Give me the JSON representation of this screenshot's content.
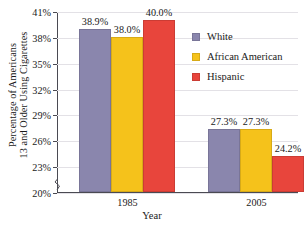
{
  "chart_data": {
    "type": "bar",
    "title": "",
    "xlabel": "Year",
    "ylabel": "Percentage of Americans 13 and Older Using Cigarettes",
    "ylabel_line1": "Percentage of Americans",
    "ylabel_line2": "13 and Older Using Cigarettes",
    "categories": [
      "1985",
      "2005"
    ],
    "series": [
      {
        "name": "White",
        "color": "#8a86ad",
        "values": [
          38.9,
          27.3
        ],
        "labels": [
          "38.9%",
          "27.3%"
        ]
      },
      {
        "name": "African American",
        "color": "#f5c21b",
        "values": [
          38.0,
          27.3
        ],
        "labels": [
          "38.0%",
          "27.3%"
        ]
      },
      {
        "name": "Hispanic",
        "color": "#e8453c",
        "values": [
          40.0,
          24.2
        ],
        "labels": [
          "40.0%",
          "24.2%"
        ]
      }
    ],
    "ylim": [
      20,
      41
    ],
    "ytick_step": 3,
    "ytick_labels": [
      "41%",
      "38%",
      "35%",
      "32%",
      "29%",
      "26%",
      "23%",
      "20%"
    ],
    "ytick_values": [
      41,
      38,
      35,
      32,
      29,
      26,
      23,
      20
    ],
    "grid": true,
    "axis_break": true,
    "legend_position": "right"
  },
  "legend": {
    "items": [
      {
        "label": "White",
        "color": "#8a86ad"
      },
      {
        "label": "African American",
        "color": "#f5c21b"
      },
      {
        "label": "Hispanic",
        "color": "#e8453c"
      }
    ]
  }
}
